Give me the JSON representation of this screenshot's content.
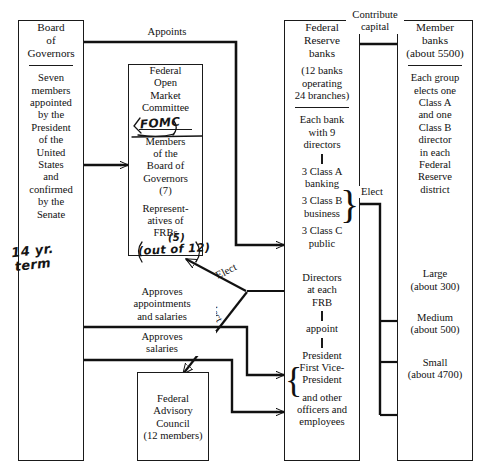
{
  "diagram": {
    "boxes": {
      "board_of_governors": {
        "head": [
          "Board",
          "of",
          "Governors"
        ],
        "body": [
          "Seven",
          "members",
          "appointed",
          "by the",
          "President",
          "of the",
          "United",
          "States",
          "and",
          "confirmed",
          "by the",
          "Senate"
        ]
      },
      "fomc": {
        "head": [
          "Federal",
          "Open",
          "Market",
          "Committee"
        ],
        "body1": [
          "Members",
          "of the",
          "Board of",
          "Governors",
          "(7)"
        ],
        "body2": [
          "Represent-",
          "atives of",
          "FRBs"
        ]
      },
      "federal_advisory_council": {
        "lines": [
          "Federal",
          "Advisory",
          "Council",
          "(12 members)"
        ]
      },
      "federal_reserve_banks": {
        "head": [
          "Federal",
          "Reserve",
          "banks"
        ],
        "sub": [
          "(12 banks",
          "operating",
          "24 branches)"
        ],
        "directors_head": [
          "Each bank",
          "with 9",
          "directors"
        ],
        "class_a": [
          "3 Class A",
          "banking"
        ],
        "class_b": [
          "3 Class B",
          "business"
        ],
        "class_c": [
          "3 Class C",
          "public"
        ],
        "directors_frb": [
          "Directors",
          "at each",
          "FRB"
        ],
        "appoint": "appoint",
        "officers": [
          "President",
          "First Vice-",
          "President"
        ],
        "others": [
          "and other",
          "officers and",
          "employees"
        ]
      },
      "member_banks": {
        "head": [
          "Member",
          "banks",
          "(about 5500)"
        ],
        "body": [
          "Each group",
          "elects one",
          "Class A",
          "and one",
          "Class B",
          "director",
          "in each",
          "Federal",
          "Reserve",
          "district"
        ],
        "large": [
          "Large",
          "(about 300)"
        ],
        "medium": [
          "Medium",
          "(about 500)"
        ],
        "small": [
          "Small",
          "(about 4700)"
        ]
      }
    },
    "edge_labels": {
      "appoints": "Appoints",
      "contribute_capital": [
        "Contribute",
        "capital"
      ],
      "elect_right": "Elect",
      "elect_diagonal": "Elect",
      "select_diagonal": "Select",
      "approves_appointments": [
        "Approves",
        "appointments",
        "and salaries"
      ],
      "approves_salaries": [
        "Approves",
        "salaries"
      ]
    },
    "annotations": {
      "term": [
        "14 yr.",
        "term"
      ],
      "fomc_abbrev": "FOMC",
      "out_of": "(out of 12)",
      "five": "(5)"
    },
    "colors": {
      "ink": "#111111",
      "paper": "#ffffff",
      "handwriting": "#151515"
    }
  }
}
